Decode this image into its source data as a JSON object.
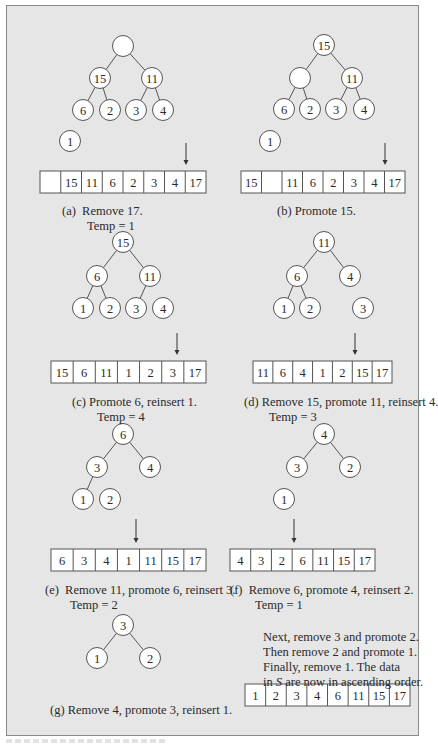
{
  "figure": {
    "node_radius": 10.5,
    "colors": {
      "panel_bg": "#e6e6e6",
      "panel_border": "#8a8a8a",
      "node_fill": "#ffffff",
      "stroke": "#555555",
      "text": "#2a2a2a"
    },
    "panels": [
      {
        "id": "a",
        "caption": [
          "(a)  Remove 17.",
          "Temp = 1"
        ],
        "caption_pos": [
          62,
          204
        ],
        "nodes": [
          {
            "x": 123,
            "y": 46,
            "label": ""
          },
          {
            "x": 100,
            "y": 78,
            "label": "15"
          },
          {
            "x": 152,
            "y": 78,
            "label": "11"
          },
          {
            "x": 83,
            "y": 110,
            "label": "6"
          },
          {
            "x": 110,
            "y": 110,
            "label": "2"
          },
          {
            "x": 136,
            "y": 110,
            "label": "3"
          },
          {
            "x": 163,
            "y": 110,
            "label": "4"
          },
          {
            "x": 70,
            "y": 141,
            "label": "1"
          }
        ],
        "edges": [
          [
            0,
            1
          ],
          [
            0,
            2
          ],
          [
            1,
            3
          ],
          [
            1,
            4
          ],
          [
            2,
            5
          ],
          [
            2,
            6
          ]
        ],
        "array": {
          "x": 40,
          "y": 171,
          "w": 166,
          "h": 22,
          "cells": [
            "",
            "15",
            "11",
            "6",
            "2",
            "3",
            "4",
            "17"
          ]
        },
        "arrow": {
          "x": 186,
          "y1": 143,
          "y2": 165
        }
      },
      {
        "id": "b",
        "caption": [
          "(b) Promote 15."
        ],
        "caption_pos": [
          277,
          204
        ],
        "nodes": [
          {
            "x": 324,
            "y": 45,
            "label": "15"
          },
          {
            "x": 300,
            "y": 78,
            "label": ""
          },
          {
            "x": 352,
            "y": 78,
            "label": "11"
          },
          {
            "x": 284,
            "y": 109,
            "label": "6"
          },
          {
            "x": 310,
            "y": 109,
            "label": "2"
          },
          {
            "x": 336,
            "y": 109,
            "label": "3"
          },
          {
            "x": 364,
            "y": 109,
            "label": "4"
          },
          {
            "x": 270,
            "y": 141,
            "label": "1"
          }
        ],
        "edges": [
          [
            0,
            1
          ],
          [
            0,
            2
          ],
          [
            1,
            3
          ],
          [
            1,
            4
          ],
          [
            2,
            5
          ],
          [
            2,
            6
          ]
        ],
        "array": {
          "x": 241,
          "y": 171,
          "w": 164,
          "h": 22,
          "cells": [
            "15",
            "",
            "11",
            "6",
            "2",
            "3",
            "4",
            "17"
          ]
        },
        "arrow": {
          "x": 385,
          "y1": 143,
          "y2": 165
        }
      },
      {
        "id": "c",
        "caption": [
          "(c) Promote 6, reinsert 1.",
          "Temp = 4"
        ],
        "caption_pos": [
          72,
          395
        ],
        "nodes": [
          {
            "x": 123,
            "y": 242,
            "label": "15"
          },
          {
            "x": 97,
            "y": 276,
            "label": "6"
          },
          {
            "x": 150,
            "y": 276,
            "label": "11"
          },
          {
            "x": 83,
            "y": 308,
            "label": "1"
          },
          {
            "x": 110,
            "y": 308,
            "label": "2"
          },
          {
            "x": 136,
            "y": 308,
            "label": "3"
          },
          {
            "x": 163,
            "y": 308,
            "label": "4"
          }
        ],
        "edges": [
          [
            0,
            1
          ],
          [
            0,
            2
          ],
          [
            1,
            3
          ],
          [
            1,
            4
          ],
          [
            2,
            5
          ]
        ],
        "array": {
          "x": 51,
          "y": 361,
          "w": 155,
          "h": 22,
          "cells": [
            "15",
            "6",
            "11",
            "1",
            "2",
            "3",
            "17"
          ]
        },
        "arrow": {
          "x": 177,
          "y1": 333,
          "y2": 355
        }
      },
      {
        "id": "d",
        "caption": [
          "(d) Remove 15, promote 11, reinsert 4.",
          "Temp = 3"
        ],
        "caption_pos": [
          244,
          395
        ],
        "nodes": [
          {
            "x": 324,
            "y": 242,
            "label": "11"
          },
          {
            "x": 297,
            "y": 276,
            "label": "6"
          },
          {
            "x": 350,
            "y": 276,
            "label": "4"
          },
          {
            "x": 284,
            "y": 308,
            "label": "1"
          },
          {
            "x": 310,
            "y": 308,
            "label": "2"
          },
          {
            "x": 363,
            "y": 308,
            "label": "3"
          }
        ],
        "edges": [
          [
            0,
            1
          ],
          [
            0,
            2
          ],
          [
            1,
            3
          ],
          [
            1,
            4
          ]
        ],
        "array": {
          "x": 253,
          "y": 361,
          "w": 139,
          "h": 22,
          "cells": [
            "11",
            "6",
            "4",
            "1",
            "2",
            "15",
            "17"
          ]
        },
        "arrow": {
          "x": 355,
          "y1": 333,
          "y2": 355
        }
      },
      {
        "id": "e",
        "caption": [
          "(e)  Remove 11, promote 6, reinsert 3.",
          "Temp = 2"
        ],
        "caption_pos": [
          45,
          583
        ],
        "nodes": [
          {
            "x": 123,
            "y": 434,
            "label": "6"
          },
          {
            "x": 97,
            "y": 467,
            "label": "3"
          },
          {
            "x": 150,
            "y": 467,
            "label": "4"
          },
          {
            "x": 83,
            "y": 499,
            "label": "1"
          },
          {
            "x": 110,
            "y": 499,
            "label": "2"
          }
        ],
        "edges": [
          [
            0,
            1
          ],
          [
            0,
            2
          ],
          [
            1,
            3
          ]
        ],
        "array": {
          "x": 51,
          "y": 549,
          "w": 155,
          "h": 22,
          "cells": [
            "6",
            "3",
            "4",
            "1",
            "11",
            "15",
            "17"
          ]
        },
        "arrow": {
          "x": 136,
          "y1": 519,
          "y2": 543
        }
      },
      {
        "id": "f",
        "caption": [
          "(f)  Remove 6, promote 4, reinsert 2.",
          "Temp = 1"
        ],
        "caption_pos": [
          230,
          583
        ],
        "nodes": [
          {
            "x": 324,
            "y": 434,
            "label": "4"
          },
          {
            "x": 297,
            "y": 467,
            "label": "3"
          },
          {
            "x": 350,
            "y": 467,
            "label": "2"
          },
          {
            "x": 284,
            "y": 499,
            "label": "1"
          }
        ],
        "edges": [
          [
            0,
            1
          ],
          [
            0,
            2
          ]
        ],
        "array": {
          "x": 230,
          "y": 549,
          "w": 145,
          "h": 22,
          "cells": [
            "4",
            "3",
            "2",
            "6",
            "11",
            "15",
            "17"
          ]
        },
        "arrow": {
          "x": 294,
          "y1": 519,
          "y2": 543
        }
      },
      {
        "id": "g",
        "caption": [
          "(g) Remove 4, promote 3, reinsert 1."
        ],
        "caption_pos": [
          50,
          703
        ],
        "nodes": [
          {
            "x": 123,
            "y": 625,
            "label": "3"
          },
          {
            "x": 97,
            "y": 658,
            "label": "1"
          },
          {
            "x": 150,
            "y": 658,
            "label": "2"
          }
        ],
        "edges": [
          [
            0,
            1
          ],
          [
            0,
            2
          ]
        ],
        "array": null,
        "arrow": null
      }
    ],
    "final_note": {
      "lines": [
        "Next, remove 3 and promote 2.",
        "Then remove 2 and promote 1.",
        "Finally, remove 1. The data"
      ],
      "last_line_prefix": "in ",
      "last_line_var": "S",
      "last_line_suffix": " are now in ascending order.",
      "pos": [
        263,
        630
      ]
    },
    "final_array": {
      "x": 245,
      "y": 684,
      "w": 165,
      "h": 22,
      "cells": [
        "1",
        "2",
        "3",
        "4",
        "6",
        "11",
        "15",
        "17"
      ]
    }
  }
}
